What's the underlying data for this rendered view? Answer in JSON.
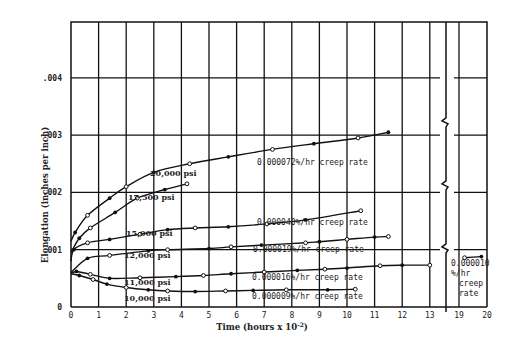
{
  "chart_data": {
    "type": "line",
    "title": "",
    "xlabel": "Time (hours x 10",
    "xlabel_exp": "-2",
    "xlabel_close": ")",
    "ylabel": "Elongation (inches per inch)",
    "xlim": [
      0,
      20
    ],
    "x_break": [
      13.5,
      18.5
    ],
    "ylim": [
      0,
      0.005
    ],
    "x_ticks": [
      "0",
      "1",
      "2",
      "3",
      "4",
      "5",
      "6",
      "7",
      "8",
      "9",
      "10",
      "11",
      "12",
      "13",
      "19",
      "20"
    ],
    "x_tick_values": [
      0,
      1,
      2,
      3,
      4,
      5,
      6,
      7,
      8,
      9,
      10,
      11,
      12,
      13,
      19,
      20
    ],
    "y_ticks": [
      "0",
      ".001",
      ".002",
      ".003",
      ".004"
    ],
    "y_tick_values": [
      0,
      0.001,
      0.002,
      0.003,
      0.004
    ],
    "grid": true,
    "series": [
      {
        "name": "20,000 psi",
        "creep_rate": "0.000072%/hr creep rate",
        "x": [
          0,
          0.15,
          0.6,
          1.4,
          2,
          3,
          4.3,
          5.7,
          7.3,
          8.8,
          10.4,
          11.5
        ],
        "y": [
          0.00115,
          0.0013,
          0.0016,
          0.0019,
          0.0021,
          0.00235,
          0.0025,
          0.00262,
          0.00275,
          0.00285,
          0.00295,
          0.00305
        ]
      },
      {
        "name": "17,500 psi",
        "creep_rate": "",
        "x": [
          0,
          0.3,
          0.7,
          1.6,
          2.4,
          3.4,
          4.2
        ],
        "y": [
          0.00095,
          0.0012,
          0.00138,
          0.00165,
          0.0019,
          0.00205,
          0.00215
        ]
      },
      {
        "name": "15,000 psi",
        "creep_rate": "0.000040%/hr creep rate",
        "x": [
          0,
          0.1,
          0.6,
          1.4,
          2.5,
          3.5,
          4.5,
          5.7,
          7.1,
          8.5,
          10.5
        ],
        "y": [
          0.0008,
          0.001,
          0.00112,
          0.00118,
          0.00127,
          0.00135,
          0.00138,
          0.0014,
          0.00145,
          0.00152,
          0.00168
        ]
      },
      {
        "name": "12,000 psi",
        "creep_rate": "0.000019%/hr creep rate",
        "x": [
          0,
          0.6,
          1.4,
          2.8,
          3.5,
          5,
          5.8,
          6.9,
          8.5,
          9,
          10,
          11,
          11.5
        ],
        "y": [
          0.0006,
          0.00085,
          0.0009,
          0.00098,
          0.001,
          0.00102,
          0.00105,
          0.00108,
          0.00112,
          0.00114,
          0.00118,
          0.00122,
          0.00123
        ]
      },
      {
        "name": "11,000 psi",
        "creep_rate": "0.000016%/hr creep rate",
        "x": [
          0,
          0.2,
          0.7,
          1.4,
          2.5,
          3.8,
          4.8,
          5.8,
          7,
          8.2,
          9.2,
          10,
          11.2,
          12,
          13
        ],
        "y": [
          0.00058,
          0.00062,
          0.00057,
          0.0005,
          0.00051,
          0.00053,
          0.00055,
          0.00058,
          0.00061,
          0.00064,
          0.00066,
          0.00068,
          0.00072,
          0.00073,
          0.00073
        ]
      },
      {
        "name": "10,000 psi",
        "creep_rate": "0.000009%/hr creep rate",
        "x": [
          0,
          0.3,
          0.8,
          1.3,
          2,
          2.8,
          3.5,
          4.5,
          5.6,
          6.6,
          7.8,
          9.3,
          10.3
        ],
        "y": [
          0.00058,
          0.00055,
          0.00048,
          0.0004,
          0.00034,
          0.0003,
          0.00028,
          0.00027,
          0.00028,
          0.00029,
          0.0003,
          0.0003,
          0.00031
        ]
      },
      {
        "name": "long-term segment",
        "creep_rate": "0.000010%/hr creep rate",
        "x": [
          19.2,
          19.8
        ],
        "y": [
          0.00086,
          0.00088
        ]
      }
    ],
    "annotations": {
      "right_panel": [
        "0.000010",
        "%/hr",
        "creep",
        "rate"
      ]
    }
  }
}
